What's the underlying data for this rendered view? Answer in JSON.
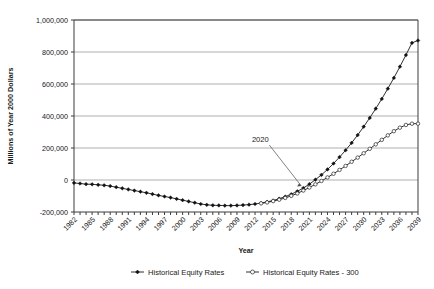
{
  "chart_data": {
    "type": "line",
    "title": "",
    "xlabel": "Year",
    "ylabel": "Millions of Year 2000 Dollars",
    "ylim": [
      -200000,
      1000000
    ],
    "ytick_values": [
      1000000,
      800000,
      600000,
      400000,
      200000,
      0,
      -200000
    ],
    "ytick_labels": [
      "1,000,000",
      "800,000",
      "600,000",
      "400,000",
      "200,000",
      "0",
      "-200,000"
    ],
    "xlim": [
      1982,
      2039
    ],
    "grid": true,
    "legend_position": "bottom",
    "x": [
      1982,
      1983,
      1984,
      1985,
      1986,
      1987,
      1988,
      1989,
      1990,
      1991,
      1992,
      1993,
      1994,
      1995,
      1996,
      1997,
      1998,
      1999,
      2000,
      2001,
      2002,
      2003,
      2004,
      2005,
      2006,
      2007,
      2008,
      2009,
      2010,
      2011,
      2012,
      2013,
      2014,
      2015,
      2016,
      2017,
      2018,
      2019,
      2020,
      2021,
      2022,
      2023,
      2024,
      2025,
      2026,
      2027,
      2028,
      2029,
      2030,
      2031,
      2032,
      2033,
      2034,
      2035,
      2036,
      2037,
      2038,
      2039
    ],
    "xtick_labels": [
      "1982",
      "1985",
      "1988",
      "1991",
      "1994",
      "1997",
      "2000",
      "2003",
      "2006",
      "2009",
      "2012",
      "2015",
      "2018",
      "2021",
      "2024",
      "2027",
      "2030",
      "2033",
      "2036",
      "2039"
    ],
    "xtick_step": 3,
    "series": [
      {
        "name": "Historical Equity Rates",
        "marker": "filled-diamond",
        "values": [
          -18000,
          -22000,
          -26000,
          -27000,
          -30000,
          -33000,
          -38000,
          -45000,
          -52000,
          -59000,
          -66000,
          -73000,
          -80000,
          -88000,
          -96000,
          -103000,
          -110000,
          -118000,
          -126000,
          -134000,
          -142000,
          -150000,
          -155000,
          -158000,
          -159000,
          -160000,
          -160000,
          -159000,
          -157000,
          -154000,
          -150000,
          -144000,
          -137000,
          -128000,
          -117000,
          -104000,
          -89000,
          -71000,
          -50000,
          -26000,
          2000,
          32000,
          66000,
          103000,
          143000,
          186000,
          232000,
          281000,
          333000,
          388000,
          446000,
          507000,
          571000,
          638000,
          708000,
          781000,
          857000,
          872000
        ]
      },
      {
        "name": "Historical Equity Rates - 300",
        "marker": "open-circle",
        "start_year": 2013,
        "values": [
          null,
          null,
          null,
          null,
          null,
          null,
          null,
          null,
          null,
          null,
          null,
          null,
          null,
          null,
          null,
          null,
          null,
          null,
          null,
          null,
          null,
          null,
          null,
          null,
          null,
          null,
          null,
          null,
          null,
          null,
          null,
          -146000,
          -140000,
          -132000,
          -123000,
          -112000,
          -99000,
          -84000,
          -66000,
          -47000,
          -27000,
          -6000,
          16000,
          39000,
          63000,
          88000,
          114000,
          140000,
          167000,
          195000,
          223000,
          251000,
          279000,
          305000,
          327000,
          344000,
          352000,
          352000
        ]
      }
    ],
    "annotations": [
      {
        "text": "2020",
        "target_year": 2020,
        "target_value": -50000
      }
    ]
  }
}
